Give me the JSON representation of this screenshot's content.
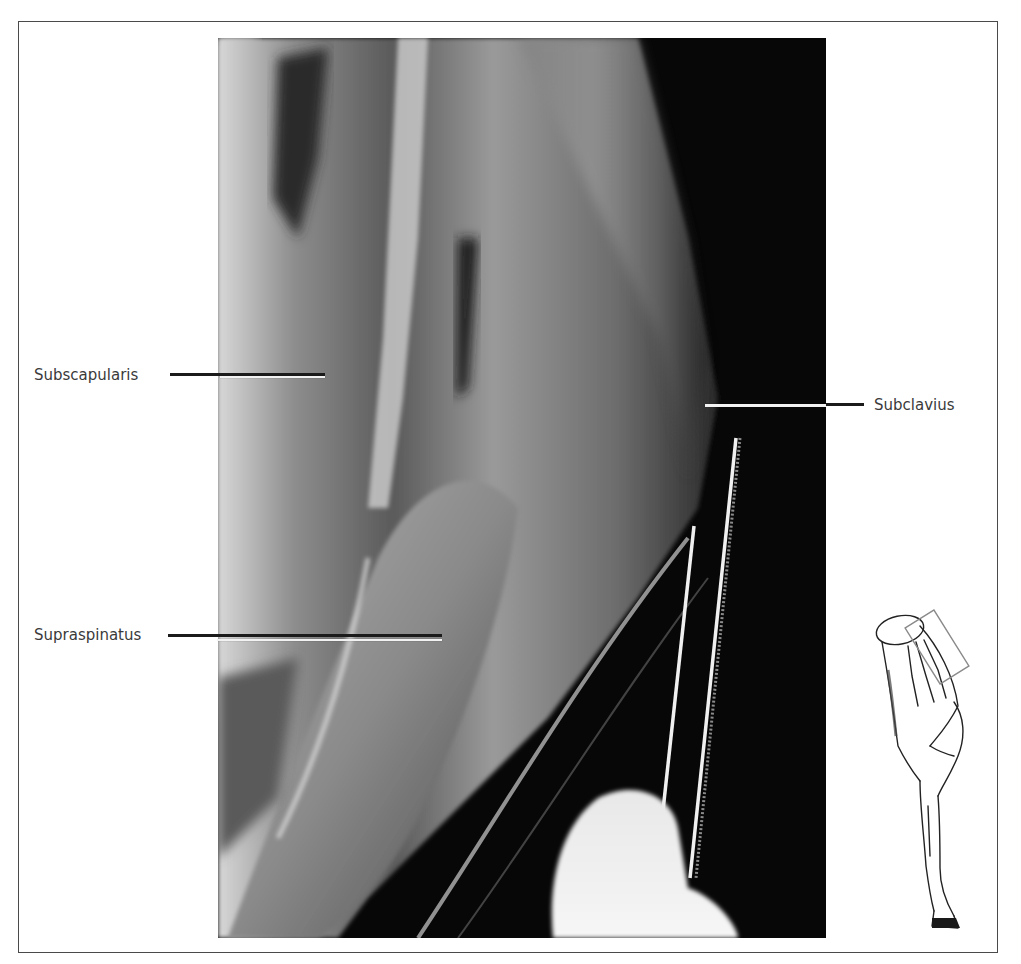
{
  "figure": {
    "labels": {
      "subscapularis": "Subscapularis",
      "supraspinatus": "Supraspinatus",
      "subclavius": "Subclavius"
    },
    "inset": {
      "description": "Line drawing of the forelimb with a rectangle marking the photographed area"
    },
    "colors": {
      "frame": "#4a4a4a",
      "label_text": "#3a3a3a",
      "leader_dark": "#1b1b1b",
      "leader_light": "#f2f2f2",
      "photo_background": "#060606"
    }
  }
}
